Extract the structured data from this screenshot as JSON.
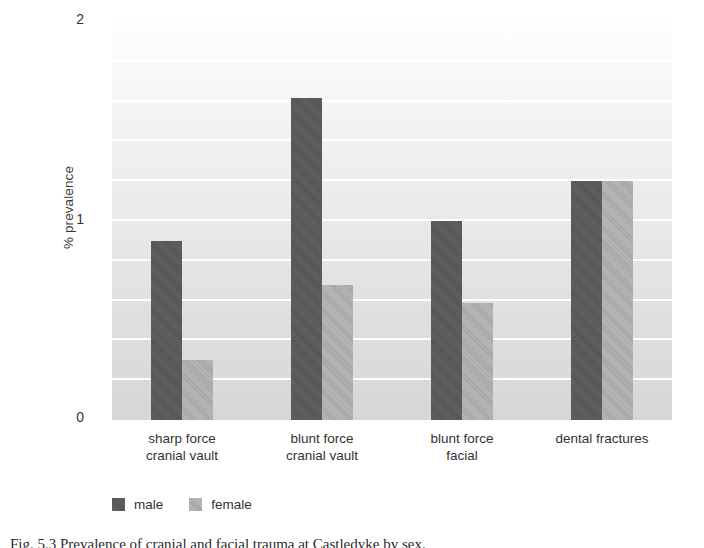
{
  "chart_data": {
    "type": "bar",
    "title": "",
    "xlabel": "",
    "ylabel": "% prevalence",
    "ylim": [
      0,
      2
    ],
    "yticks": [
      0,
      1,
      2
    ],
    "ytick_labels": [
      "0",
      "1",
      "2"
    ],
    "gridlines_every": 0.2,
    "grid": true,
    "legend_position": "bottom-left",
    "categories": [
      "sharp force cranial vault",
      "blunt force cranial vault",
      "blunt force facial",
      "dental fractures"
    ],
    "category_lines": [
      [
        "sharp force",
        "cranial vault"
      ],
      [
        "blunt force",
        "cranial vault"
      ],
      [
        "blunt force",
        "facial"
      ],
      [
        "dental fractures",
        ""
      ]
    ],
    "series": [
      {
        "name": "male",
        "color": "#585858",
        "values": [
          0.9,
          1.62,
          1.0,
          1.2
        ]
      },
      {
        "name": "female",
        "color": "#a9a9a9",
        "values": [
          0.3,
          0.68,
          0.59,
          1.2
        ]
      }
    ]
  },
  "axis": {
    "y_title": "% prevalence",
    "y_labels": {
      "top": "2",
      "middle": "1",
      "bottom": "0"
    }
  },
  "legend": {
    "items": [
      {
        "label": "male",
        "swatch": "male-swatch"
      },
      {
        "label": "female",
        "swatch": "female-swatch"
      }
    ]
  },
  "caption": {
    "text": "Fig. 5.3  Prevalence of cranial and facial trauma at Castledyke by sex."
  }
}
